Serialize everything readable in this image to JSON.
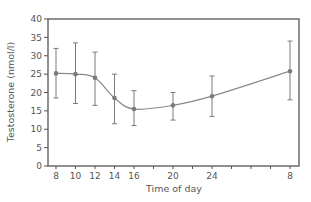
{
  "chart_data": {
    "type": "line",
    "title": "",
    "xlabel": "Time of day",
    "ylabel": "Testosterone (nmol/l)",
    "ylim": [
      0,
      40
    ],
    "yticks": [
      0,
      5,
      10,
      15,
      20,
      25,
      30,
      35,
      40
    ],
    "xtick_labels": [
      "8",
      "10",
      "12",
      "14",
      "16",
      "20",
      "24",
      "8"
    ],
    "grid": false,
    "legend": null,
    "series": [
      {
        "name": "Testosterone",
        "x": [
          "8",
          "10",
          "12",
          "14",
          "16",
          "20",
          "24",
          "8"
        ],
        "x_hours": [
          8,
          10,
          12,
          14,
          16,
          20,
          24,
          32
        ],
        "values": [
          25.2,
          25.0,
          24.0,
          18.5,
          15.5,
          16.5,
          19.0,
          25.8
        ],
        "error_low": [
          18.5,
          17.0,
          16.5,
          11.5,
          11.0,
          12.5,
          13.5,
          18.0
        ],
        "error_high": [
          32.0,
          33.5,
          31.0,
          25.0,
          20.5,
          20.0,
          24.5,
          34.0
        ]
      }
    ],
    "colors": {
      "axis": "#555555",
      "line": "#8a8a8a",
      "marker": "#7a7a7a"
    }
  }
}
